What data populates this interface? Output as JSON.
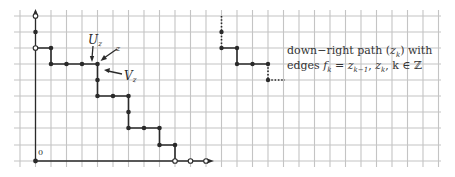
{
  "labels": {
    "origin": "0",
    "U": "U",
    "U_sub": "z",
    "V": "V",
    "V_sub": "z",
    "z": "z"
  },
  "caption": {
    "line1_prefix": "down−right path (",
    "line1_var": "z",
    "line1_sub": "k",
    "line1_suffix": ") with",
    "line2_prefix": "edges ",
    "line2_f": "f",
    "line2_f_sub": "k",
    "line2_eq": " = ",
    "line2_z1": "z",
    "line2_z1_sub": "k−1",
    "line2_sep": ", ",
    "line2_z2": "z",
    "line2_z2_sub": "k",
    "line2_tail": ", k ∈ ℤ"
  },
  "colors": {
    "grid": "#c4c4c4",
    "path": "#2a2a2a",
    "background": "#ffffff"
  }
}
